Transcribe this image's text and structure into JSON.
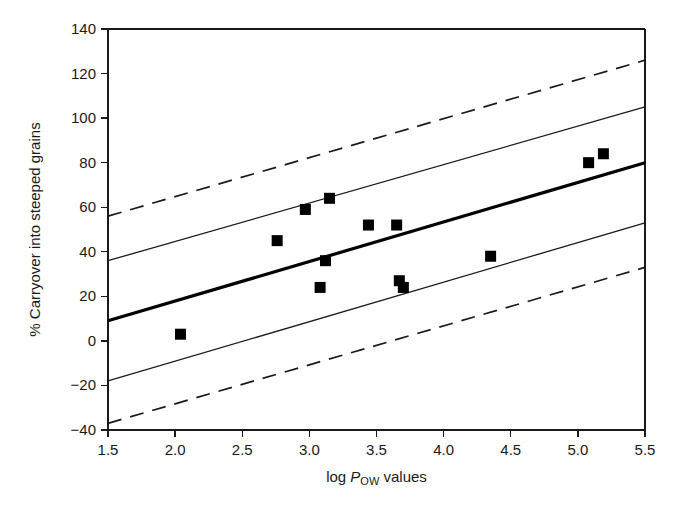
{
  "figure": {
    "background": "#ffffff",
    "ink_color": "#111111"
  },
  "axes": {
    "x": {
      "label_plain": "log Pow values",
      "label_prefix": "log ",
      "label_italic": "P",
      "label_subscript": "OW",
      "label_suffix": " values",
      "min": 1.5,
      "max": 5.5,
      "tick_step": 0.5,
      "ticks": [
        "1.5",
        "2.0",
        "2.5",
        "3.0",
        "3.5",
        "4.0",
        "4.5",
        "5.0",
        "5.5"
      ]
    },
    "y": {
      "label": "% Carryover into steeped grains",
      "min": -40,
      "max": 140,
      "tick_step": 20,
      "ticks": [
        "140",
        "120",
        "100",
        "80",
        "60",
        "40",
        "20",
        "0",
        "−20",
        "−40"
      ]
    }
  },
  "chart_data": {
    "type": "scatter",
    "title": "",
    "xlabel": "log Pow values",
    "ylabel": "% Carryover into steeped grains",
    "xlim": [
      1.5,
      5.5
    ],
    "ylim": [
      -40,
      140
    ],
    "grid": false,
    "legend": "none",
    "x": [
      2.04,
      2.76,
      2.97,
      3.08,
      3.12,
      3.15,
      3.44,
      3.65,
      3.67,
      3.7,
      4.35,
      5.08,
      5.19
    ],
    "y": [
      3,
      45,
      59,
      24,
      36,
      64,
      52,
      52,
      27,
      24,
      38,
      80,
      84
    ],
    "points": [
      {
        "x": 2.04,
        "y": 3
      },
      {
        "x": 2.76,
        "y": 45
      },
      {
        "x": 2.97,
        "y": 59
      },
      {
        "x": 3.08,
        "y": 24
      },
      {
        "x": 3.12,
        "y": 36
      },
      {
        "x": 3.15,
        "y": 64
      },
      {
        "x": 3.44,
        "y": 52
      },
      {
        "x": 3.65,
        "y": 52
      },
      {
        "x": 3.67,
        "y": 27
      },
      {
        "x": 3.7,
        "y": 24
      },
      {
        "x": 4.35,
        "y": 38
      },
      {
        "x": 5.08,
        "y": 80
      },
      {
        "x": 5.19,
        "y": 84
      }
    ],
    "marker": {
      "shape": "square",
      "size_px": 11,
      "color": "#000000"
    },
    "series": [
      {
        "name": "regression-line",
        "style": "solid-bold",
        "x": [
          1.5,
          5.5
        ],
        "values": [
          9,
          80
        ]
      },
      {
        "name": "confidence-band-upper",
        "style": "solid-thin",
        "x": [
          1.5,
          5.5
        ],
        "values": [
          36,
          105
        ]
      },
      {
        "name": "confidence-band-lower",
        "style": "solid-thin",
        "x": [
          1.5,
          5.5
        ],
        "values": [
          -18,
          53
        ]
      },
      {
        "name": "prediction-band-upper",
        "style": "dashed",
        "x": [
          1.5,
          5.5
        ],
        "values": [
          56,
          126
        ]
      },
      {
        "name": "prediction-band-lower",
        "style": "dashed",
        "x": [
          1.5,
          5.5
        ],
        "values": [
          -37,
          33
        ]
      }
    ]
  }
}
